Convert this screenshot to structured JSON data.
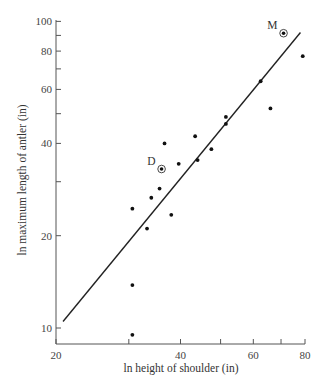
{
  "chart_data": {
    "type": "scatter",
    "title": "",
    "xlabel": "ln height of shoulder (in)",
    "ylabel": "ln maximum length of antler (in)",
    "x_scale": "log",
    "y_scale": "log",
    "xlim": [
      20,
      80
    ],
    "ylim": [
      9,
      100
    ],
    "x_ticks": [
      20,
      30,
      40,
      50,
      60,
      70,
      80
    ],
    "x_tick_labels": [
      "20",
      "",
      "40",
      "",
      "60",
      "",
      "80"
    ],
    "y_ticks": [
      10,
      20,
      30,
      40,
      50,
      60,
      70,
      80,
      90,
      100
    ],
    "y_tick_labels": [
      "10",
      "20",
      "",
      "40",
      "",
      "60",
      "",
      "80",
      "",
      "100"
    ],
    "grid": false,
    "legend": null,
    "points": [
      {
        "x": 30.6,
        "y": 9.5
      },
      {
        "x": 30.6,
        "y": 13.8
      },
      {
        "x": 30.6,
        "y": 24.5
      },
      {
        "x": 33.2,
        "y": 21.1
      },
      {
        "x": 34.0,
        "y": 26.6
      },
      {
        "x": 35.6,
        "y": 28.5
      },
      {
        "x": 36.0,
        "y": 33.0,
        "label": "D",
        "highlight": true
      },
      {
        "x": 36.6,
        "y": 40.0
      },
      {
        "x": 38.0,
        "y": 23.4
      },
      {
        "x": 39.6,
        "y": 34.3
      },
      {
        "x": 43.4,
        "y": 42.2
      },
      {
        "x": 44.0,
        "y": 35.3
      },
      {
        "x": 47.5,
        "y": 38.3
      },
      {
        "x": 51.5,
        "y": 46.3
      },
      {
        "x": 51.5,
        "y": 48.8
      },
      {
        "x": 62.5,
        "y": 63.8
      },
      {
        "x": 66.0,
        "y": 52.0
      },
      {
        "x": 71.0,
        "y": 91.5,
        "label": "M",
        "highlight": true
      },
      {
        "x": 79.0,
        "y": 77.0
      }
    ],
    "fit_line": {
      "x": [
        20.8,
        78.0
      ],
      "y": [
        10.5,
        92.0
      ]
    }
  },
  "axes": {
    "xlabel": "ln height of shoulder (in)",
    "ylabel": "ln maximum length of antler (in)"
  }
}
